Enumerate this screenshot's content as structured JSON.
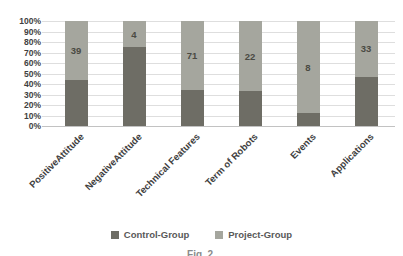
{
  "chart_data": {
    "type": "bar",
    "variant": "100%-stacked-column",
    "title": "",
    "xlabel": "",
    "ylabel": "",
    "ylim": [
      0,
      100
    ],
    "grid": "horizontal",
    "legend_position": "bottom",
    "categories": [
      "PositiveAttitude",
      "NegativeAttitude",
      "Technical Features",
      "Term of Robots",
      "Events",
      "Applications"
    ],
    "yticks": [
      "0%",
      "10%",
      "20%",
      "30%",
      "40%",
      "50%",
      "60%",
      "70%",
      "80%",
      "90%",
      "100%"
    ],
    "series": [
      {
        "name": "Control-Group",
        "color": "#6e6d65",
        "values_pct": [
          44,
          75,
          34,
          33,
          12,
          47
        ]
      },
      {
        "name": "Project-Group",
        "color": "#a5a69e",
        "values_pct": [
          56,
          25,
          66,
          67,
          88,
          53
        ],
        "data_labels": [
          39,
          4,
          71,
          22,
          8,
          33
        ]
      }
    ],
    "colors": {
      "gridline": "#dedede",
      "axis_line": "#c2c2c2",
      "tick_text": "#3f3f3f",
      "data_label_text": "#4a4a43",
      "legend_text": "#595959"
    }
  },
  "caption": "Fig. 2."
}
